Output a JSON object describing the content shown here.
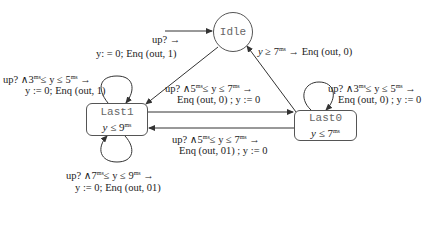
{
  "diagram": {
    "type": "timed-automaton",
    "nodes": {
      "idle": {
        "name": "Idle",
        "shape": "circle",
        "initial": true
      },
      "last1": {
        "name": "Last1",
        "shape": "rounded-rect",
        "invariant": "y ≤ 9",
        "invariant_var": "y",
        "invariant_op": "≤",
        "invariant_val": "9",
        "sup": "ms"
      },
      "last0": {
        "name": "Last0",
        "shape": "rounded-rect",
        "invariant": "y ≤ 7",
        "invariant_var": "y",
        "invariant_op": "≤",
        "invariant_val": "7",
        "sup": "ms"
      }
    },
    "edges": {
      "init_to_last1": {
        "from": "Idle",
        "to": "Last1",
        "guard_line": "up? →",
        "action_line": "y: = 0; Enq (out, 1)"
      },
      "last0_to_idle": {
        "from": "Last0",
        "to": "Idle",
        "line": "y ≥ 7 → Enq (out, 0)",
        "pre": "y ≥ 7",
        "post": "→ Enq (out, 0)"
      },
      "last1_self_top": {
        "from": "Last1",
        "to": "Last1",
        "guard_pre": "up? ∧3",
        "guard_mid": "≤ y ≤ 5",
        "guard_post": "→",
        "action_line": "y := 0; Enq (out, 1)"
      },
      "last1_self_bottom": {
        "from": "Last1",
        "to": "Last1",
        "guard_pre": "up? ∧7",
        "guard_mid": "≤ y ≤ 9",
        "guard_post": "→",
        "action_line": "y := 0; Enq (out, 01)"
      },
      "last0_self": {
        "from": "Last0",
        "to": "Last0",
        "guard_pre": "up? ∧3",
        "guard_mid": "≤ y ≤ 5",
        "guard_post": "→",
        "action_line": "Enq (out, 0) ; y := 0"
      },
      "last1_to_last0": {
        "from": "Last1",
        "to": "Last0",
        "guard_pre": "up? ∧5",
        "guard_mid": "≤ y ≤ 7",
        "guard_post": "→",
        "action_line": "Enq (out, 0) ; y := 0"
      },
      "last0_to_last1": {
        "from": "Last0",
        "to": "Last1",
        "guard_pre": "up? ∧5",
        "guard_mid": "≤ y ≤ 7",
        "guard_post": "→",
        "action_line": "Enq (out, 01) ; y := 0"
      }
    },
    "unit_sup": "ms"
  }
}
